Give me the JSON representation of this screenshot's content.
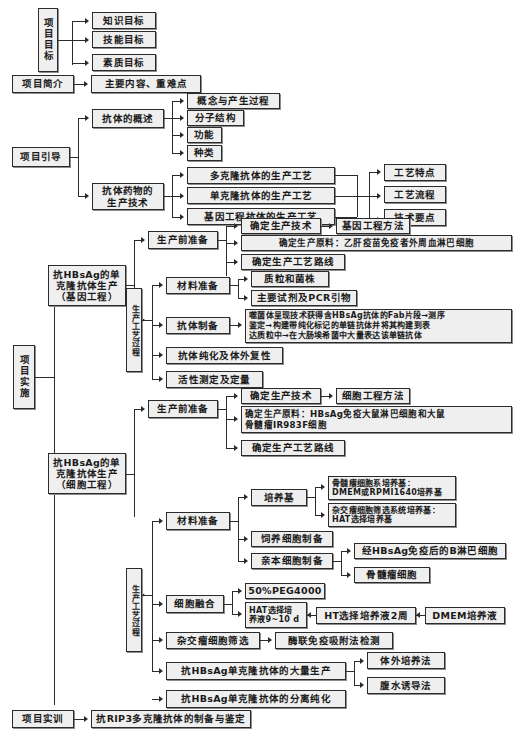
{
  "diagram": {
    "type": "hierarchical-flowchart",
    "language": "zh-CN"
  },
  "nodes": {
    "project_goal": "项目目标",
    "goal_knowledge": "知识目标",
    "goal_skill": "技能目标",
    "goal_quality": "素质目标",
    "project_intro": "项目简介",
    "intro_main": "主要内容、重难点",
    "project_guide": "项目引导",
    "antibody_overview": "抗体的概述",
    "ov_concept": "概念与产生过程",
    "ov_structure": "分子结构",
    "ov_function": "功能",
    "ov_types": "种类",
    "antibody_drug_tech": "抗体药物的\n生产技术",
    "tech_poly": "多克隆抗体的生产工艺",
    "tech_mono": "单克隆抗体的生产工艺",
    "tech_gene": "基因工程抗体的生产工艺",
    "tech_feature": "工艺特点",
    "tech_flow": "工艺流程",
    "tech_points": "技术要点",
    "project_impl": "项目实施",
    "gene_eng_title": "抗HBsAg的单\n克隆抗体生产\n（基因工程）",
    "ge_pre_prep": "生产前准备",
    "ge_pre_tech": "确定生产技术",
    "ge_pre_tech_sub": "基因工程方法",
    "ge_pre_material": "确定生产原料：乙肝疫苗免疫者外周血淋巴细胞",
    "ge_pre_route": "确定生产工艺路线",
    "ge_process_label": "生产工艺过程",
    "ge_material_prep": "材料准备",
    "ge_plasmid": "质粒和菌株",
    "ge_reagents": "主要试剂及PCR引物",
    "ge_ab_prep": "抗体制备",
    "ge_ab_prep_detail": "噬菌体呈现技术获得含HBsAg抗体的Fab片段→测序\n鉴定→构建带纯化标记的单链抗体并将其构建到表\n达质粒中→在大肠埃希菌中大量表达该单链抗体",
    "ge_purify": "抗体纯化及体外复性",
    "ge_activity": "活性测定及定量",
    "cell_eng_title": "抗HBsAg的单\n克隆抗体生产\n（细胞工程）",
    "ce_pre_prep": "生产前准备",
    "ce_pre_tech": "确定生产技术",
    "ce_pre_tech_sub": "细胞工程方法",
    "ce_pre_material": "确定生产原料：HBsAg免疫大鼠淋巴细胞和大鼠\n骨髓瘤IR983F细胞",
    "ce_pre_route": "确定生产工艺路线",
    "ce_process_label": "生产工艺过程",
    "ce_material_prep": "材料准备",
    "ce_medium": "培养基",
    "ce_medium_myeloma": "骨髓瘤细胞系培养基：\nDMEM或RPMI1640培养基",
    "ce_medium_hybrid": "杂交瘤细胞筛选系统培养基：\nHAT选择培养基",
    "ce_feeder": "饲养细胞制备",
    "ce_parent": "亲本细胞制备",
    "ce_parent_b": "经HBsAg免疫后的B淋巴细胞",
    "ce_parent_myeloma": "骨髓瘤细胞",
    "ce_fusion": "细胞融合",
    "ce_peg": "50%PEG4000",
    "ce_hat": "HAT选择培\n养液9~10 d",
    "ce_ht": "HT选择培养液2周",
    "ce_dmem": "DMEM培养液",
    "ce_screen": "杂交瘤细胞筛选",
    "ce_elisa": "酶联免疫吸附法检测",
    "ce_mass_prod": "抗HBsAg单克隆抗体的大量生产",
    "ce_invitro": "体外培养法",
    "ce_ascites": "腹水诱导法",
    "ce_isolation": "抗HBsAg单克隆抗体的分离纯化",
    "project_training": "项目实训",
    "training_item": "抗RIP3多克隆抗体的制备与鉴定"
  },
  "style": {
    "box_fill": "#efefef",
    "box_border": "#2b2b2b",
    "text_color": "#1a1a1a",
    "page_background": "#ffffff"
  }
}
